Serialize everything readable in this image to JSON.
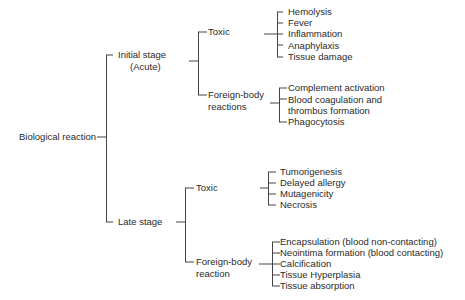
{
  "diagram": {
    "root": "Biological reaction",
    "stages": [
      {
        "label_line1": "Initial stage",
        "label_line2": "(Acute)",
        "branches": [
          {
            "label": "Toxic",
            "items": [
              "Hemolysis",
              "Fever",
              "Inflammation",
              "Anaphylaxis",
              "Tissue damage"
            ]
          },
          {
            "label_line1": "Foreign-body",
            "label_line2": "reactions",
            "items": [
              "Complement activation",
              "Blood coagulation and",
              "thrombus formation",
              "Phagocytosis"
            ]
          }
        ]
      },
      {
        "label_line1": "Late stage",
        "branches": [
          {
            "label": "Toxic",
            "items": [
              "Tumorigenesis",
              "Delayed allergy",
              "Mutagenicity",
              "Necrosis"
            ]
          },
          {
            "label_line1": "Foreign-body",
            "label_line2": "reaction",
            "items": [
              "Encapsulation  (blood non-contacting)",
              "Neointima formation (blood contacting)",
              "Calcification",
              "Tissue Hyperplasia",
              "Tissue absorption"
            ]
          }
        ]
      }
    ]
  }
}
